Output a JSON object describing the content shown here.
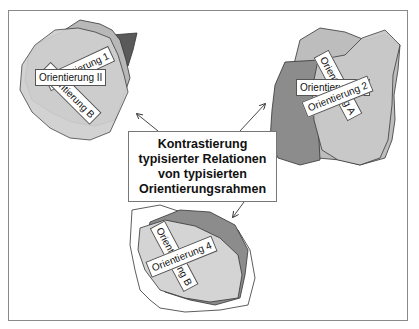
{
  "diagram": {
    "center_box": {
      "lines": [
        "Kontrastierung",
        "typisierter Relationen",
        "von typisierten",
        "Orientierungsrahmen"
      ]
    },
    "clusters": [
      {
        "position": "top-left",
        "labels": [
          "Orientierung 1",
          "Orientierung II",
          "Orientierung B"
        ]
      },
      {
        "position": "top-right",
        "labels": [
          "Orientierung A",
          "Orientierung 2",
          "Orientierung III"
        ]
      },
      {
        "position": "bottom-center",
        "labels": [
          "Orientierung B",
          "Orientierung 4"
        ]
      }
    ],
    "colors": {
      "light_fill": "#d4d4d4",
      "mid_fill": "#b8b8b8",
      "dark_fill": "#5a5a5a",
      "medium_dark_fill": "#8c8c8c",
      "outline": "#333333",
      "frame_border": "#8a8a8a"
    }
  }
}
